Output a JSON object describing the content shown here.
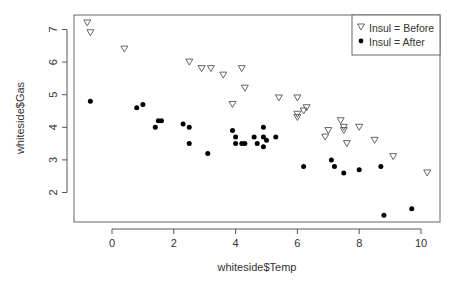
{
  "chart_data": {
    "type": "scatter",
    "title": "",
    "xlabel": "whiteside$Temp",
    "ylabel": "whiteside$Gas",
    "xlim": [
      -1.25,
      10.7
    ],
    "ylim": [
      1.05,
      7.45
    ],
    "x_ticks": [
      0,
      2,
      4,
      6,
      8,
      10
    ],
    "y_ticks": [
      2,
      3,
      4,
      5,
      6,
      7
    ],
    "grid": false,
    "legend_position": "top-right",
    "series": [
      {
        "name": "Insul = Before",
        "marker": "open-triangle-down",
        "points": [
          [
            -0.8,
            7.2
          ],
          [
            -0.7,
            6.9
          ],
          [
            0.4,
            6.4
          ],
          [
            2.5,
            6.0
          ],
          [
            2.9,
            5.8
          ],
          [
            3.2,
            5.8
          ],
          [
            3.6,
            5.6
          ],
          [
            3.9,
            4.7
          ],
          [
            4.2,
            5.8
          ],
          [
            4.3,
            5.2
          ],
          [
            5.4,
            4.9
          ],
          [
            6.0,
            4.9
          ],
          [
            6.0,
            4.3
          ],
          [
            6.0,
            4.4
          ],
          [
            6.2,
            4.5
          ],
          [
            6.3,
            4.6
          ],
          [
            6.9,
            3.7
          ],
          [
            7.0,
            3.9
          ],
          [
            7.4,
            4.2
          ],
          [
            7.5,
            4.0
          ],
          [
            7.5,
            3.9
          ],
          [
            7.6,
            3.5
          ],
          [
            8.0,
            4.0
          ],
          [
            8.5,
            3.6
          ],
          [
            9.1,
            3.1
          ],
          [
            10.2,
            2.6
          ]
        ]
      },
      {
        "name": "Insul = After",
        "marker": "filled-circle",
        "points": [
          [
            -0.7,
            4.8
          ],
          [
            0.8,
            4.6
          ],
          [
            1.0,
            4.7
          ],
          [
            1.4,
            4.0
          ],
          [
            1.5,
            4.2
          ],
          [
            1.6,
            4.2
          ],
          [
            2.3,
            4.1
          ],
          [
            2.5,
            4.0
          ],
          [
            2.5,
            3.5
          ],
          [
            3.1,
            3.2
          ],
          [
            3.9,
            3.9
          ],
          [
            4.0,
            3.5
          ],
          [
            4.0,
            3.7
          ],
          [
            4.2,
            3.5
          ],
          [
            4.3,
            3.5
          ],
          [
            4.6,
            3.7
          ],
          [
            4.7,
            3.5
          ],
          [
            4.9,
            3.4
          ],
          [
            4.9,
            3.7
          ],
          [
            4.9,
            4.0
          ],
          [
            5.0,
            3.6
          ],
          [
            5.3,
            3.7
          ],
          [
            6.2,
            2.8
          ],
          [
            7.1,
            3.0
          ],
          [
            7.2,
            2.8
          ],
          [
            7.5,
            2.6
          ],
          [
            8.0,
            2.7
          ],
          [
            8.7,
            2.8
          ],
          [
            8.8,
            1.3
          ],
          [
            9.7,
            1.5
          ]
        ]
      }
    ]
  },
  "legend": {
    "items": [
      {
        "label": "Insul = Before",
        "marker": "open-triangle-down"
      },
      {
        "label": "Insul = After",
        "marker": "filled-circle"
      }
    ]
  },
  "colors": {
    "axis": "#555555",
    "marker_before_stroke": "#555555",
    "marker_after_fill": "#000000",
    "text": "#333333"
  }
}
